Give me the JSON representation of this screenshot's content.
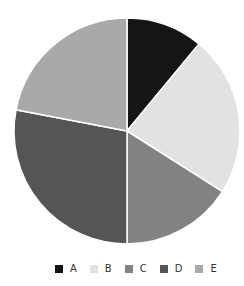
{
  "chart_data": {
    "type": "pie",
    "title": "",
    "categories": [
      "A",
      "B",
      "C",
      "D",
      "E"
    ],
    "values": [
      11,
      23,
      16,
      28,
      22
    ],
    "colors": [
      "#151515",
      "#e2e2e2",
      "#828282",
      "#555555",
      "#a9a9a9"
    ],
    "start_angle": "12 o'clock",
    "direction": "clockwise",
    "legend_position": "bottom",
    "slice_border_color": "#ffffff"
  },
  "legend": {
    "items": [
      {
        "label": "A",
        "color": "#151515"
      },
      {
        "label": "B",
        "color": "#e2e2e2"
      },
      {
        "label": "C",
        "color": "#828282"
      },
      {
        "label": "D",
        "color": "#555555"
      },
      {
        "label": "E",
        "color": "#a9a9a9"
      }
    ]
  }
}
